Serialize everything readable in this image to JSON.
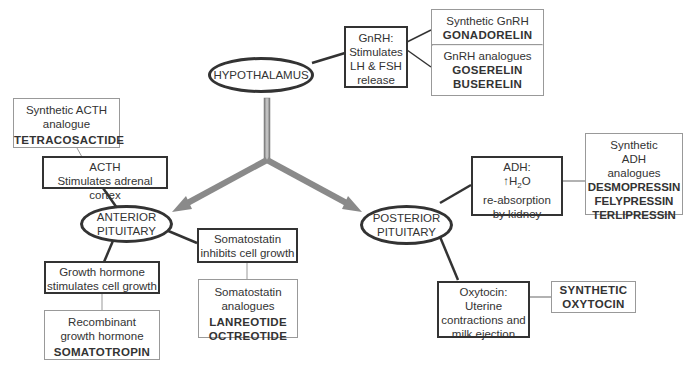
{
  "nodes": {
    "hypothalamus": {
      "label": "HYPOTHALAMUS"
    },
    "anterior_pituitary": {
      "line1": "ANTERIOR",
      "line2": "PITUITARY"
    },
    "posterior_pituitary": {
      "line1": "POSTERIOR",
      "line2": "PITUITARY"
    }
  },
  "gnrh": {
    "lines": [
      "GnRH:",
      "Stimulates",
      "LH & FSH",
      "release"
    ],
    "synthetic_label": "Synthetic GnRH",
    "synthetic_drug": "GONADORELIN",
    "analogues_label": "GnRH analogues",
    "analogue_drugs": [
      "GOSERELIN",
      "BUSERELIN"
    ]
  },
  "acth": {
    "line1": "ACTH",
    "line2": "Stimulates adrenal cortex",
    "synthetic_line1": "Synthetic ACTH",
    "synthetic_line2": "analogue",
    "synthetic_drug": "TETRACOSACTIDE"
  },
  "growth_hormone": {
    "line1": "Growth hormone",
    "line2": "stimulates cell growth",
    "recombinant_line1": "Recombinant",
    "recombinant_line2": "growth hormone",
    "recombinant_drug": "SOMATOTROPIN"
  },
  "somatostatin": {
    "line1": "Somatostatin",
    "line2": "inhibits cell growth",
    "analogues_line1": "Somatostatin",
    "analogues_line2": "analogues",
    "analogue_drugs": [
      "LANREOTIDE",
      "OCTREOTIDE"
    ]
  },
  "adh": {
    "line1": "ADH:",
    "line2_arrow": "↑",
    "line2_text": "H",
    "line2_sub": "2",
    "line2_tail": "O",
    "line3": "re-absorption",
    "line4": "by kidney",
    "synthetic_lines": [
      "Synthetic",
      "ADH",
      "analogues"
    ],
    "analogue_drugs": [
      "DESMOPRESSIN",
      "FELYPRESSIN",
      "TERLIPRESSIN"
    ]
  },
  "oxytocin": {
    "lines": [
      "Oxytocin:",
      "Uterine",
      "contractions and",
      "milk ejection"
    ],
    "synthetic_lines": [
      "SYNTHETIC",
      "OXYTOCIN"
    ]
  },
  "colors": {
    "dark_border": "#333333",
    "light_border": "#999999",
    "arrow_fill": "#8a8a8a"
  }
}
